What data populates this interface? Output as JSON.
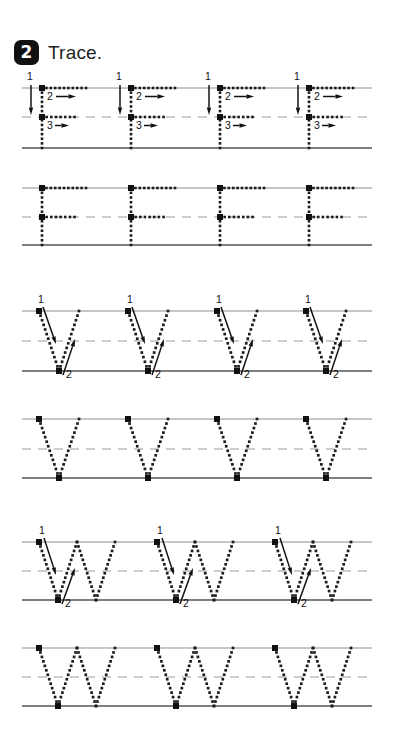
{
  "page": {
    "background": "#ffffff",
    "width": 402,
    "height": 754
  },
  "header": {
    "step_number": "2",
    "instruction": "Trace.",
    "badge_color": "#111111",
    "badge_text_color": "#ffffff"
  },
  "style": {
    "ruled_line_color": "#8d8d8d",
    "baseline_color": "#555555",
    "dashed_line_color": "#9a9a9a",
    "dot_color": "#1c1c1c",
    "arrow_color": "#111111",
    "stroke_number_color": "#111111",
    "start_dot_color": "#111111"
  },
  "rows": [
    {
      "name": "row-f-guided",
      "letter": "F",
      "guided": true,
      "top": 88,
      "mid": 117,
      "base": 148,
      "line_start": 22,
      "line_end": 372,
      "letters": [
        {
          "x": 42,
          "width": 44,
          "stroke_labels": [
            "1",
            "2",
            "3"
          ]
        },
        {
          "x": 131,
          "width": 44,
          "stroke_labels": [
            "1",
            "2",
            "3"
          ]
        },
        {
          "x": 220,
          "width": 44,
          "stroke_labels": [
            "1",
            "2",
            "3"
          ]
        },
        {
          "x": 309,
          "width": 44,
          "stroke_labels": [
            "1",
            "2",
            "3"
          ]
        }
      ]
    },
    {
      "name": "row-f-plain",
      "letter": "F",
      "guided": false,
      "top": 188,
      "mid": 217,
      "base": 245,
      "line_start": 22,
      "line_end": 372,
      "letters": [
        {
          "x": 42,
          "width": 44,
          "stroke_labels": []
        },
        {
          "x": 131,
          "width": 44,
          "stroke_labels": []
        },
        {
          "x": 220,
          "width": 44,
          "stroke_labels": []
        },
        {
          "x": 309,
          "width": 44,
          "stroke_labels": []
        }
      ]
    },
    {
      "name": "row-v-guided",
      "letter": "V",
      "guided": true,
      "top": 311,
      "mid": 341,
      "base": 371,
      "line_start": 22,
      "line_end": 372,
      "letters": [
        {
          "x": 39,
          "width": 40,
          "stroke_labels": [
            "1",
            "2"
          ]
        },
        {
          "x": 128,
          "width": 40,
          "stroke_labels": [
            "1",
            "2"
          ]
        },
        {
          "x": 217,
          "width": 40,
          "stroke_labels": [
            "1",
            "2"
          ]
        },
        {
          "x": 306,
          "width": 40,
          "stroke_labels": [
            "1",
            "2"
          ]
        }
      ]
    },
    {
      "name": "row-v-plain",
      "letter": "V",
      "guided": false,
      "top": 419,
      "mid": 449,
      "base": 478,
      "line_start": 22,
      "line_end": 372,
      "letters": [
        {
          "x": 39,
          "width": 40,
          "stroke_labels": []
        },
        {
          "x": 128,
          "width": 40,
          "stroke_labels": []
        },
        {
          "x": 217,
          "width": 40,
          "stroke_labels": []
        },
        {
          "x": 306,
          "width": 40,
          "stroke_labels": []
        }
      ]
    },
    {
      "name": "row-w-guided",
      "letter": "W",
      "guided": true,
      "top": 542,
      "mid": 571,
      "base": 600,
      "line_start": 22,
      "line_end": 372,
      "letters": [
        {
          "x": 39,
          "width": 76,
          "stroke_labels": [
            "1",
            "2"
          ]
        },
        {
          "x": 157,
          "width": 76,
          "stroke_labels": [
            "1",
            "2"
          ]
        },
        {
          "x": 275,
          "width": 76,
          "stroke_labels": [
            "1",
            "2"
          ]
        }
      ]
    },
    {
      "name": "row-w-plain",
      "letter": "W",
      "guided": false,
      "top": 648,
      "mid": 677,
      "base": 706,
      "line_start": 22,
      "line_end": 372,
      "letters": [
        {
          "x": 39,
          "width": 76,
          "stroke_labels": []
        },
        {
          "x": 157,
          "width": 76,
          "stroke_labels": []
        },
        {
          "x": 275,
          "width": 76,
          "stroke_labels": []
        }
      ]
    }
  ]
}
